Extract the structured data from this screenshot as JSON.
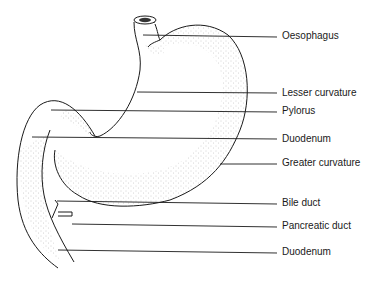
{
  "diagram": {
    "stroke_color": "#1a1a1a",
    "stipple_color": "#555555",
    "labels": [
      {
        "id": "oesophagus",
        "text": "Oesophagus",
        "y": 36
      },
      {
        "id": "lesser-curvature",
        "text": "Lesser curvature",
        "y": 92
      },
      {
        "id": "pylorus",
        "text": "Pylorus",
        "y": 110
      },
      {
        "id": "duodenum-upper",
        "text": "Duodenum",
        "y": 138
      },
      {
        "id": "greater-curvature",
        "text": "Greater curvature",
        "y": 160
      },
      {
        "id": "bile-duct",
        "text": "Bile duct",
        "y": 201
      },
      {
        "id": "pancreatic-duct",
        "text": "Pancreatic duct",
        "y": 225
      },
      {
        "id": "duodenum-lower",
        "text": "Duodenum",
        "y": 252
      }
    ]
  }
}
